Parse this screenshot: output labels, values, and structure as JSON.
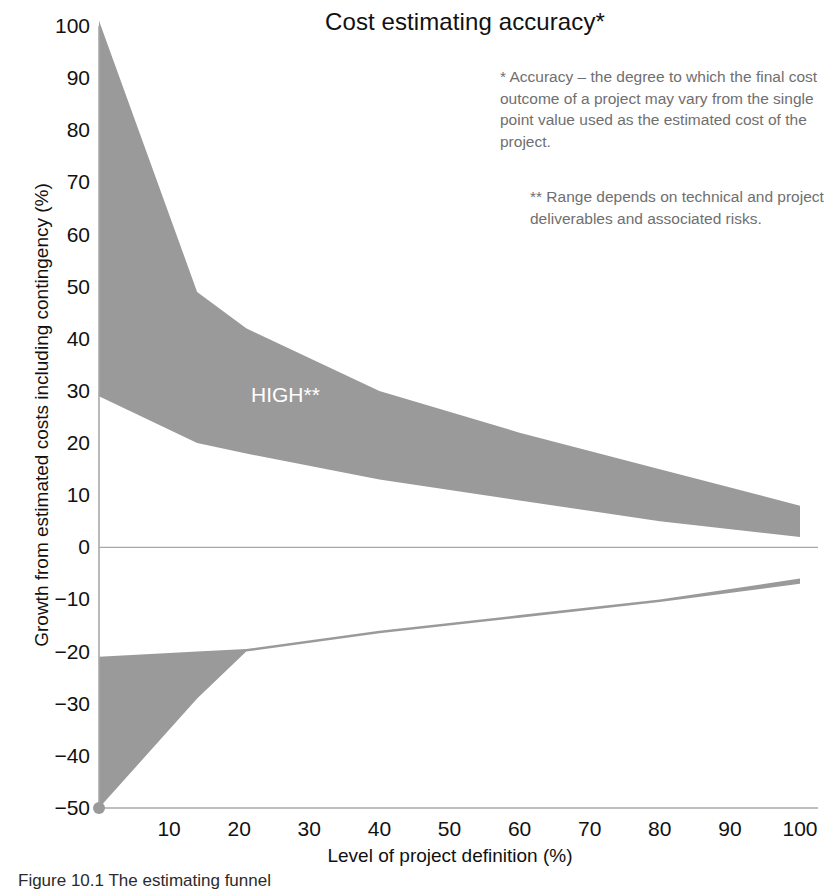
{
  "chart_data": {
    "type": "area",
    "title": "Cost estimating accuracy*",
    "xlabel": "Level of project definition (%)",
    "ylabel": "Growth from estimated costs including contingency (%)",
    "xlim": [
      0,
      100
    ],
    "ylim": [
      -50,
      100
    ],
    "xticks": [
      10,
      20,
      30,
      40,
      50,
      60,
      70,
      80,
      90,
      100
    ],
    "yticks": [
      100,
      90,
      80,
      70,
      60,
      50,
      40,
      30,
      20,
      10,
      0,
      -10,
      -20,
      -30,
      -40,
      -50
    ],
    "grid": false,
    "legend_position": "inline-band-labels",
    "fill_color": "#9a9a9a",
    "axis_color": "#a8a8a8",
    "series": [
      {
        "name": "HIGH**",
        "role": "upper-band-top",
        "x": [
          0,
          14,
          21,
          40,
          60,
          80,
          100
        ],
        "values": [
          101,
          49,
          42,
          30,
          22,
          15,
          8
        ]
      },
      {
        "name": "HIGH**",
        "role": "upper-band-bottom",
        "x": [
          0,
          14,
          21,
          40,
          60,
          80,
          100
        ],
        "values": [
          29,
          20,
          18,
          13,
          9,
          5,
          2
        ]
      },
      {
        "name": "LOW**",
        "role": "lower-band-top",
        "x": [
          0,
          14,
          21,
          40,
          60,
          80,
          100
        ],
        "values": [
          -21,
          -20,
          -19.5,
          -16,
          -13,
          -10,
          -6
        ]
      },
      {
        "name": "LOW**",
        "role": "lower-band-bottom",
        "x": [
          0,
          14,
          21,
          40,
          60,
          80,
          100
        ],
        "values": [
          -50,
          -29,
          -20,
          -16.5,
          -13.5,
          -10.5,
          -7
        ]
      }
    ],
    "annotations": [
      {
        "text": "HIGH**",
        "x": 22,
        "y": 32
      },
      {
        "text": "LOW**",
        "x": 21,
        "y": -14
      }
    ]
  },
  "title": "Cost estimating accuracy*",
  "axes": {
    "x_title": "Level of project definition (%)",
    "y_title": "Growth from estimated costs including contingency (%)",
    "x_labels": [
      "10",
      "20",
      "30",
      "40",
      "50",
      "60",
      "70",
      "80",
      "90",
      "100"
    ],
    "y_labels": [
      "100",
      "90",
      "80",
      "70",
      "60",
      "50",
      "40",
      "30",
      "20",
      "10",
      "0",
      "−10",
      "−20",
      "−30",
      "−40",
      "−50"
    ]
  },
  "band_labels": {
    "high": "HIGH**",
    "low": "LOW**"
  },
  "footnotes": {
    "one": "* Accuracy – the degree to which the final cost outcome of a project may vary from the single point value used as the estimated cost of the project.",
    "two": "** Range depends on technical and project deliverables and associated risks."
  },
  "caption": "Figure 10.1 The estimating funnel",
  "colors": {
    "band_fill": "#9a9a9a",
    "axis": "#a8a8a8",
    "text": "#111111",
    "footnote_text": "#6f6f6f",
    "band_label_text": "#ffffff"
  }
}
